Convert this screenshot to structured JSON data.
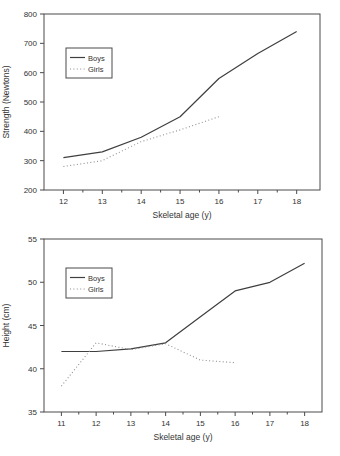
{
  "chart_data": [
    {
      "type": "line",
      "title": "",
      "xlabel": "Skeletal age (y)",
      "ylabel": "Strength (Newtons)",
      "xlim": [
        11.5,
        18.6
      ],
      "ylim": [
        200,
        800
      ],
      "xticks": [
        12,
        13,
        14,
        15,
        16,
        17,
        18
      ],
      "yticks": [
        200,
        300,
        400,
        500,
        600,
        700,
        800
      ],
      "x_minor_step": 0.5,
      "grid": false,
      "frame_color": "#4a4a4a",
      "legend": {
        "position": "upper-left-inside"
      },
      "series": [
        {
          "name": "Boys",
          "line_style": "solid",
          "color": "#3f3f3f",
          "x": [
            12,
            13,
            14,
            15,
            16,
            17,
            18
          ],
          "values": [
            310,
            330,
            380,
            450,
            580,
            665,
            740
          ]
        },
        {
          "name": "Girls",
          "line_style": "dotted",
          "color": "#8f8f8f",
          "x": [
            12,
            13,
            14,
            15,
            16
          ],
          "values": [
            280,
            300,
            365,
            405,
            450
          ]
        }
      ]
    },
    {
      "type": "line",
      "title": "",
      "xlabel": "Skeletal age (y)",
      "ylabel": "Height (cm)",
      "xlim": [
        10.5,
        18.5
      ],
      "ylim": [
        35,
        55
      ],
      "xticks": [
        11,
        12,
        13,
        14,
        15,
        16,
        17,
        18
      ],
      "yticks": [
        35,
        40,
        45,
        50,
        55
      ],
      "x_minor_step": 0.5,
      "grid": false,
      "frame_color": "#4a4a4a",
      "legend": {
        "position": "upper-left-inside"
      },
      "series": [
        {
          "name": "Boys",
          "line_style": "solid",
          "color": "#3f3f3f",
          "x": [
            11,
            12,
            13,
            14,
            15,
            16,
            17,
            18
          ],
          "values": [
            42,
            42,
            42.3,
            43,
            46,
            49,
            50,
            52.2
          ]
        },
        {
          "name": "Girls",
          "line_style": "dotted",
          "color": "#8f8f8f",
          "x": [
            11,
            12,
            13,
            14,
            15,
            16
          ],
          "values": [
            38,
            43,
            42.2,
            42.9,
            41,
            40.7
          ]
        }
      ]
    }
  ]
}
